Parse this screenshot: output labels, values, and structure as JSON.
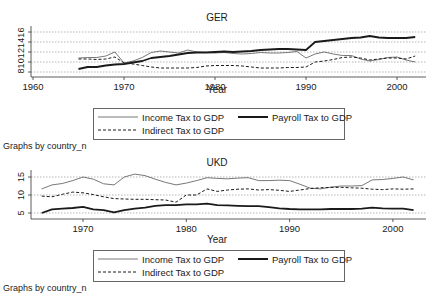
{
  "chart_data": [
    {
      "type": "line",
      "title": "GER",
      "xlabel": "Year",
      "ylabel": "",
      "xlim": [
        1960,
        2003
      ],
      "ylim": [
        8,
        16
      ],
      "xticks": [
        1960,
        1970,
        1980,
        1990,
        2000
      ],
      "yticks": [
        8,
        10,
        12,
        14,
        16
      ],
      "grid": true,
      "x": [
        1965,
        1966,
        1967,
        1968,
        1969,
        1970,
        1971,
        1972,
        1973,
        1974,
        1975,
        1976,
        1977,
        1978,
        1979,
        1980,
        1981,
        1982,
        1983,
        1984,
        1985,
        1986,
        1987,
        1988,
        1989,
        1990,
        1991,
        1992,
        1993,
        1994,
        1995,
        1996,
        1997,
        1998,
        1999,
        2000,
        2001,
        2002
      ],
      "series": [
        {
          "name": "Income Tax to GDP",
          "style": "thin",
          "values": [
            10.8,
            10.9,
            10.9,
            11.2,
            12.0,
            9.8,
            10.2,
            10.9,
            11.9,
            12.2,
            12.0,
            11.8,
            12.4,
            12.0,
            11.9,
            11.8,
            11.9,
            11.7,
            11.6,
            11.7,
            11.9,
            11.8,
            11.8,
            11.9,
            12.1,
            10.8,
            11.6,
            12.0,
            11.6,
            11.3,
            11.3,
            10.6,
            10.2,
            10.5,
            10.9,
            11.0,
            10.4,
            10.0
          ]
        },
        {
          "name": "Payroll Tax to GDP",
          "style": "thick",
          "values": [
            8.6,
            9.0,
            9.0,
            9.3,
            9.5,
            9.6,
            9.9,
            10.2,
            10.8,
            11.0,
            11.2,
            11.5,
            11.8,
            11.9,
            11.9,
            12.0,
            12.1,
            12.0,
            12.1,
            12.2,
            12.4,
            12.5,
            12.6,
            12.6,
            12.5,
            12.4,
            14.0,
            14.2,
            14.4,
            14.6,
            14.8,
            14.9,
            15.2,
            14.9,
            14.8,
            14.8,
            14.8,
            15.0
          ]
        },
        {
          "name": "Indirect Tax to GDP",
          "style": "dashed",
          "values": [
            10.6,
            10.6,
            10.5,
            10.6,
            11.0,
            9.8,
            9.6,
            9.3,
            9.0,
            8.8,
            8.8,
            8.8,
            8.8,
            8.9,
            9.2,
            9.3,
            9.3,
            9.3,
            9.2,
            9.0,
            8.8,
            8.8,
            8.8,
            8.9,
            8.9,
            9.0,
            10.0,
            10.2,
            10.5,
            10.9,
            11.0,
            10.8,
            10.4,
            10.6,
            10.8,
            10.8,
            10.6,
            11.2
          ]
        }
      ],
      "legend": [
        "Income Tax to GDP",
        "Payroll Tax to GDP",
        "Indirect Tax to GDP"
      ],
      "legend_position": "bottom"
    },
    {
      "type": "line",
      "title": "UKD",
      "xlabel": "Year",
      "ylabel": "",
      "xlim": [
        1966,
        2003
      ],
      "ylim": [
        4.5,
        16
      ],
      "xticks": [
        1970,
        1980,
        1990,
        2000
      ],
      "yticks": [
        5,
        10,
        15
      ],
      "grid": true,
      "x": [
        1966,
        1967,
        1968,
        1969,
        1970,
        1971,
        1972,
        1973,
        1974,
        1975,
        1976,
        1977,
        1978,
        1979,
        1980,
        1981,
        1982,
        1983,
        1984,
        1985,
        1986,
        1987,
        1988,
        1989,
        1990,
        1991,
        1992,
        1993,
        1994,
        1995,
        1996,
        1997,
        1998,
        1999,
        2000,
        2001,
        2002
      ],
      "series": [
        {
          "name": "Income Tax to GDP",
          "style": "thin",
          "values": [
            11.7,
            12.8,
            13.2,
            14.0,
            15.0,
            14.4,
            13.1,
            12.8,
            15.0,
            15.8,
            15.4,
            14.4,
            13.5,
            12.8,
            13.3,
            14.0,
            14.8,
            14.6,
            14.5,
            14.7,
            14.8,
            14.0,
            14.0,
            14.1,
            14.0,
            13.0,
            11.9,
            11.7,
            12.2,
            12.5,
            12.5,
            12.6,
            14.2,
            14.3,
            14.6,
            15.0,
            14.2
          ]
        },
        {
          "name": "Payroll Tax to GDP",
          "style": "thick",
          "values": [
            5.0,
            6.0,
            6.2,
            6.4,
            6.7,
            6.0,
            5.8,
            5.2,
            5.8,
            6.2,
            6.5,
            7.0,
            7.2,
            7.2,
            7.4,
            7.4,
            7.6,
            7.2,
            7.1,
            7.0,
            6.9,
            6.9,
            6.6,
            6.3,
            6.1,
            6.0,
            6.0,
            6.0,
            6.1,
            6.1,
            6.1,
            6.2,
            6.5,
            6.3,
            6.2,
            6.2,
            5.8
          ]
        },
        {
          "name": "Indirect Tax to GDP",
          "style": "dashed",
          "values": [
            9.7,
            9.5,
            10.2,
            10.8,
            10.6,
            10.1,
            9.5,
            9.0,
            8.9,
            8.8,
            8.8,
            8.7,
            8.6,
            8.0,
            10.0,
            10.0,
            11.7,
            11.0,
            11.4,
            11.6,
            11.7,
            11.4,
            11.5,
            11.3,
            11.0,
            11.4,
            11.8,
            12.0,
            12.1,
            12.1,
            12.0,
            11.9,
            11.6,
            11.5,
            11.7,
            11.6,
            11.7
          ]
        }
      ],
      "legend": [
        "Income Tax to GDP",
        "Payroll Tax to GDP",
        "Indirect Tax to GDP"
      ],
      "legend_position": "bottom"
    }
  ],
  "panels": [
    {
      "title": "GER",
      "xlabel": "Year",
      "caption": "Graphs by country_n",
      "xticks": [
        "1960",
        "1970",
        "1980",
        "1990",
        "2000"
      ],
      "yticks": [
        "8",
        "10",
        "12",
        "14",
        "16"
      ],
      "legend": {
        "income": "Income Tax to GDP",
        "payroll": "Payroll Tax to GDP",
        "indirect": "Indirect Tax to GDP"
      }
    },
    {
      "title": "UKD",
      "xlabel": "Year",
      "caption": "Graphs by country_n",
      "xticks": [
        "1970",
        "1980",
        "1990",
        "2000"
      ],
      "yticks": [
        "5",
        "10",
        "15"
      ],
      "legend": {
        "income": "Income Tax to GDP",
        "payroll": "Payroll Tax to GDP",
        "indirect": "Indirect Tax to GDP"
      }
    }
  ],
  "colors": {
    "line": "#1a1a1a",
    "income_line": "#555555",
    "grid": "#888888"
  }
}
